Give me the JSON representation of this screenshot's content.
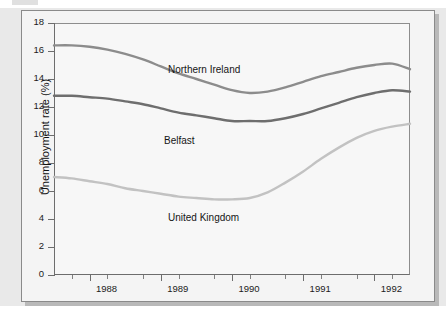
{
  "figure": {
    "source_credit": "Employment Gazette, Dept of Employment"
  },
  "chart_data": {
    "type": "line",
    "title": "",
    "xlabel": "",
    "ylabel": "Unemployment rate (%)",
    "ylim": [
      0,
      18
    ],
    "yticks": [
      0,
      2,
      4,
      6,
      8,
      10,
      12,
      14,
      16,
      18
    ],
    "ytick_labels": [
      "0",
      "2",
      "4",
      "6",
      "8",
      "10",
      "12",
      "14",
      "16",
      "18"
    ],
    "xlim": [
      1987.5,
      1992.5
    ],
    "xticks": [
      1988,
      1989,
      1990,
      1991,
      1992
    ],
    "xtick_labels": [
      "1988",
      "1989",
      "1990",
      "1991",
      "1992"
    ],
    "x_minor_ticks": [
      1987.75,
      1988.25,
      1988.75,
      1989.25,
      1989.75,
      1990.25,
      1990.75,
      1991.25,
      1991.75,
      1992.25
    ],
    "grid": false,
    "legend_position": "inline-labels",
    "x": [
      1987.5,
      1987.75,
      1988.0,
      1988.25,
      1988.5,
      1988.75,
      1989.0,
      1989.25,
      1989.5,
      1989.75,
      1990.0,
      1990.25,
      1990.5,
      1990.75,
      1991.0,
      1991.25,
      1991.5,
      1991.75,
      1992.0,
      1992.25,
      1992.5
    ],
    "series": [
      {
        "name": "Northern Ireland",
        "color": "#8c8c8c",
        "values": [
          16.4,
          16.4,
          16.3,
          16.1,
          15.8,
          15.4,
          14.9,
          14.4,
          14.0,
          13.6,
          13.2,
          13.0,
          13.1,
          13.4,
          13.8,
          14.2,
          14.5,
          14.8,
          15.0,
          15.1,
          14.7
        ]
      },
      {
        "name": "Belfast",
        "color": "#6e6e6e",
        "values": [
          12.8,
          12.8,
          12.7,
          12.6,
          12.4,
          12.2,
          11.9,
          11.6,
          11.4,
          11.2,
          11.0,
          11.0,
          11.0,
          11.2,
          11.5,
          11.9,
          12.3,
          12.7,
          13.0,
          13.2,
          13.1
        ]
      },
      {
        "name": "United Kingdom",
        "color": "#c2c2c2",
        "values": [
          7.0,
          6.9,
          6.7,
          6.5,
          6.2,
          6.0,
          5.8,
          5.6,
          5.5,
          5.4,
          5.4,
          5.5,
          5.9,
          6.6,
          7.4,
          8.3,
          9.1,
          9.8,
          10.3,
          10.6,
          10.8
        ]
      }
    ],
    "series_label_positions": [
      {
        "name": "Northern Ireland",
        "left": 146,
        "top": 53
      },
      {
        "name": "Belfast",
        "left": 142,
        "top": 124
      },
      {
        "name": "United Kingdom",
        "left": 146,
        "top": 201
      }
    ]
  }
}
